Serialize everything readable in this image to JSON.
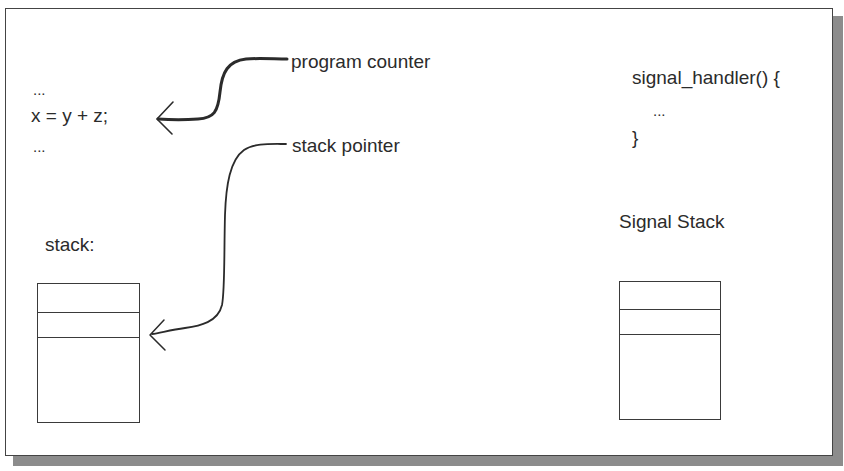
{
  "diagram": {
    "type": "signal-handling-illustration",
    "code_left": {
      "line1": "...",
      "line2": "x = y + z;",
      "line3": "..."
    },
    "labels": {
      "program_counter": "program counter",
      "stack_pointer": "stack pointer",
      "stack": "stack:",
      "signal_stack": "Signal Stack"
    },
    "code_right": {
      "line1": "signal_handler() {",
      "line2": "...",
      "line3": "}"
    },
    "stacks": [
      {
        "name": "stack",
        "slots": 3
      },
      {
        "name": "signal-stack",
        "slots": 3
      }
    ],
    "arrows": [
      {
        "from": "program counter",
        "to": "x = y + z;"
      },
      {
        "from": "stack pointer",
        "to": "stack slot 2"
      }
    ],
    "colors": {
      "line": "#2b2b2b",
      "shadow": "#8c8c8c",
      "background": "#ffffff"
    }
  }
}
